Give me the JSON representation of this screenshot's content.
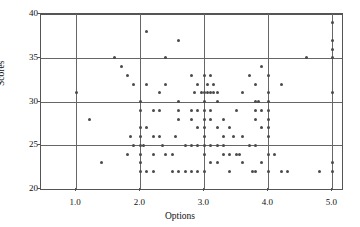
{
  "chart_data": {
    "type": "scatter",
    "title": "",
    "xlabel": "Options",
    "ylabel": "Scores",
    "xlim": [
      0.45,
      5.15
    ],
    "ylim": [
      20,
      40
    ],
    "xticks": [
      "1.0",
      "2.0",
      "3.0",
      "4.0",
      "5.0"
    ],
    "xtick_values": [
      1.0,
      2.0,
      3.0,
      4.0,
      5.0
    ],
    "yticks": [
      "20",
      "25",
      "30",
      "35",
      "40"
    ],
    "ytick_values": [
      20,
      25,
      30,
      35,
      40
    ],
    "grid": true,
    "grid_color": "#666666",
    "marker_color": "#4a4a4a",
    "legend": "none",
    "points": [
      [
        1.0,
        31
      ],
      [
        1.2,
        28
      ],
      [
        1.4,
        23
      ],
      [
        1.6,
        35
      ],
      [
        1.7,
        34
      ],
      [
        1.8,
        33
      ],
      [
        1.8,
        24
      ],
      [
        1.85,
        26
      ],
      [
        1.9,
        32
      ],
      [
        1.9,
        25
      ],
      [
        2.0,
        30
      ],
      [
        2.0,
        29
      ],
      [
        2.0,
        27
      ],
      [
        2.0,
        26
      ],
      [
        2.0,
        25
      ],
      [
        2.0,
        24
      ],
      [
        2.0,
        23
      ],
      [
        2.0,
        22
      ],
      [
        2.05,
        25
      ],
      [
        2.1,
        38
      ],
      [
        2.1,
        32
      ],
      [
        2.1,
        27
      ],
      [
        2.1,
        22
      ],
      [
        2.2,
        29
      ],
      [
        2.2,
        26
      ],
      [
        2.2,
        24
      ],
      [
        2.2,
        22
      ],
      [
        2.3,
        31
      ],
      [
        2.3,
        29
      ],
      [
        2.3,
        26
      ],
      [
        2.35,
        25
      ],
      [
        2.4,
        35
      ],
      [
        2.4,
        32
      ],
      [
        2.4,
        24
      ],
      [
        2.5,
        24
      ],
      [
        2.5,
        22
      ],
      [
        2.55,
        26
      ],
      [
        2.6,
        37
      ],
      [
        2.6,
        30
      ],
      [
        2.6,
        29
      ],
      [
        2.6,
        28
      ],
      [
        2.6,
        22
      ],
      [
        2.7,
        25
      ],
      [
        2.7,
        22
      ],
      [
        2.8,
        33
      ],
      [
        2.8,
        29
      ],
      [
        2.8,
        28
      ],
      [
        2.8,
        25
      ],
      [
        2.8,
        22
      ],
      [
        2.85,
        31
      ],
      [
        2.9,
        32
      ],
      [
        2.9,
        29
      ],
      [
        2.9,
        27
      ],
      [
        2.9,
        25
      ],
      [
        2.9,
        22
      ],
      [
        2.95,
        31
      ],
      [
        3.0,
        33
      ],
      [
        3.0,
        31
      ],
      [
        3.0,
        30
      ],
      [
        3.0,
        29
      ],
      [
        3.0,
        28
      ],
      [
        3.0,
        27
      ],
      [
        3.0,
        26
      ],
      [
        3.0,
        25
      ],
      [
        3.0,
        24
      ],
      [
        3.0,
        22
      ],
      [
        3.05,
        32
      ],
      [
        3.05,
        31
      ],
      [
        3.1,
        33
      ],
      [
        3.1,
        31
      ],
      [
        3.1,
        29
      ],
      [
        3.1,
        28
      ],
      [
        3.1,
        25
      ],
      [
        3.1,
        23
      ],
      [
        3.15,
        32
      ],
      [
        3.15,
        31
      ],
      [
        3.2,
        30
      ],
      [
        3.2,
        31
      ],
      [
        3.2,
        27
      ],
      [
        3.2,
        25
      ],
      [
        3.2,
        23
      ],
      [
        3.3,
        28
      ],
      [
        3.3,
        26
      ],
      [
        3.3,
        25
      ],
      [
        3.3,
        24
      ],
      [
        3.4,
        27
      ],
      [
        3.4,
        24
      ],
      [
        3.4,
        22
      ],
      [
        3.45,
        26
      ],
      [
        3.5,
        29
      ],
      [
        3.5,
        24
      ],
      [
        3.55,
        24
      ],
      [
        3.6,
        31
      ],
      [
        3.6,
        26
      ],
      [
        3.6,
        23
      ],
      [
        3.7,
        33
      ],
      [
        3.7,
        25
      ],
      [
        3.75,
        22
      ],
      [
        3.8,
        32
      ],
      [
        3.8,
        30
      ],
      [
        3.8,
        29
      ],
      [
        3.8,
        28
      ],
      [
        3.8,
        25
      ],
      [
        3.8,
        22
      ],
      [
        3.85,
        30
      ],
      [
        3.9,
        34
      ],
      [
        3.9,
        29
      ],
      [
        3.9,
        27
      ],
      [
        3.9,
        23
      ],
      [
        4.0,
        33
      ],
      [
        4.0,
        31
      ],
      [
        4.0,
        30
      ],
      [
        4.0,
        29
      ],
      [
        4.0,
        28
      ],
      [
        4.0,
        27
      ],
      [
        4.0,
        26
      ],
      [
        4.0,
        24
      ],
      [
        4.0,
        22
      ],
      [
        4.1,
        24
      ],
      [
        4.2,
        32
      ],
      [
        4.2,
        22
      ],
      [
        4.3,
        22
      ],
      [
        4.6,
        35
      ],
      [
        4.8,
        22
      ],
      [
        5.0,
        39
      ],
      [
        5.0,
        37
      ],
      [
        5.0,
        36
      ],
      [
        5.0,
        35
      ],
      [
        5.0,
        31
      ],
      [
        5.0,
        23
      ],
      [
        5.0,
        22
      ]
    ]
  }
}
